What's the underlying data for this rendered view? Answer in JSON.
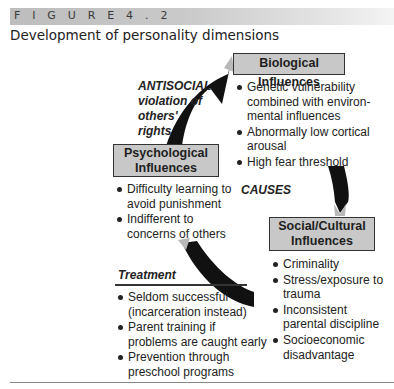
{
  "figure": {
    "label": "F I G U R E   4 . 2",
    "title": "Development of personality dimensions"
  },
  "colors": {
    "box_fill": "#c8c8c8",
    "arrow": "#111111",
    "arrow_highlight": "#b8b8b8",
    "header_bar": "#c4c4c4"
  },
  "annotations": {
    "antisocial": [
      "ANTISOCIAL",
      "violation of",
      "others'",
      "rights"
    ],
    "causes": "CAUSES"
  },
  "nodes": {
    "biological": {
      "title": "Biological Influences",
      "bullets": [
        "Genetic vulnerability combined with environ- mental influences",
        "Abnormally low cortical arousal",
        "High fear threshold"
      ]
    },
    "psychological": {
      "title_line1": "Psychological",
      "title_line2": "Influences",
      "bullets": [
        "Difficulty learning to avoid punishment",
        "Indifferent to concerns of others"
      ]
    },
    "social": {
      "title_line1": "Social/Cultural",
      "title_line2": "Influences",
      "bullets": [
        "Criminality",
        "Stress/exposure to trauma",
        "Inconsistent parental discipline",
        "Socioeconomic disadvantage"
      ]
    }
  },
  "treatment": {
    "heading": "Treatment",
    "bullets": [
      "Seldom successful (incarceration instead)",
      "Parent training if problems are caught early",
      "Prevention through preschool programs"
    ]
  }
}
